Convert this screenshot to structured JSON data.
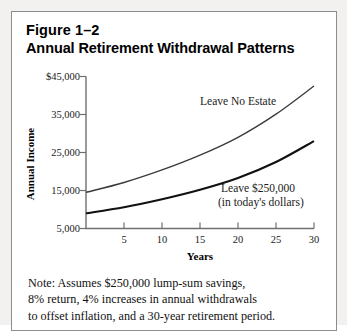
{
  "figure": {
    "number": "Figure 1–2",
    "title": "Annual Retirement Withdrawal Patterns"
  },
  "note": {
    "line1": "Note: Assumes $250,000 lump-sum savings,",
    "line2": "8% return, 4% increases in annual withdrawals",
    "line3": "to offset inflation, and a 30-year retirement period."
  },
  "chart_data": {
    "type": "line",
    "title": "Annual Retirement Withdrawal Patterns",
    "xlabel": "Years",
    "ylabel": "Annual Income",
    "xlim": [
      0,
      30
    ],
    "ylim": [
      5000,
      45000
    ],
    "grid": false,
    "legend": "inline-annotations",
    "xticks": [
      5,
      10,
      15,
      20,
      25,
      30
    ],
    "xtick_labels": [
      "5",
      "10",
      "15",
      "20",
      "25",
      "30"
    ],
    "yticks": [
      5000,
      15000,
      25000,
      35000,
      45000
    ],
    "ytick_labels": [
      "5,000",
      "15,000",
      "25,000",
      "35,000",
      "$45,000"
    ],
    "x": [
      0,
      5,
      10,
      15,
      20,
      25,
      30
    ],
    "series": [
      {
        "name": "Leave No Estate",
        "label_line1": "Leave No Estate",
        "label_line2": "",
        "values": [
          14500,
          17100,
          20400,
          24300,
          29000,
          35100,
          42500
        ]
      },
      {
        "name": "Leave $250,000",
        "label_line1": "Leave $250,000",
        "label_line2": "(in today's dollars)",
        "values": [
          9000,
          10600,
          12700,
          15200,
          18300,
          22500,
          28000
        ]
      }
    ],
    "colors": {
      "axis": "#6f6f6f",
      "upper_curve": "#3a3a3a",
      "lower_curve": "#111111",
      "text": "#1a1a1a",
      "page_background": "#f2f1ef",
      "figure_background": "#ffffff",
      "border": "#8d8d8d"
    }
  }
}
